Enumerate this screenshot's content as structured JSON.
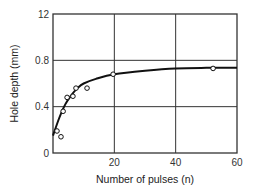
{
  "chart_data": {
    "type": "scatter",
    "title": "",
    "xlabel": "Number of pulses (n)",
    "ylabel": "Hole depth (mm)",
    "xlim": [
      0,
      60
    ],
    "ylim": [
      0,
      1.2
    ],
    "xticks": [
      {
        "value": 0,
        "label": ""
      },
      {
        "value": 20,
        "label": "20"
      },
      {
        "value": 40,
        "label": "40"
      },
      {
        "value": 60,
        "label": "60"
      }
    ],
    "yticks": [
      {
        "value": 0,
        "label": "0"
      },
      {
        "value": 0.4,
        "label": "0.4"
      },
      {
        "value": 0.8,
        "label": "0.8"
      },
      {
        "value": 1.2,
        "label": "12"
      }
    ],
    "grid": true,
    "legend": "none",
    "series": [
      {
        "name": "measured",
        "kind": "points",
        "marker": "open-circle",
        "x": [
          1.3,
          2.6,
          3.3,
          4.6,
          6.5,
          7.5,
          11.1,
          19.6,
          52.2
        ],
        "y": [
          0.19,
          0.14,
          0.36,
          0.48,
          0.49,
          0.56,
          0.56,
          0.68,
          0.73
        ]
      },
      {
        "name": "fit",
        "kind": "line",
        "x": [
          0,
          2,
          4,
          6,
          8,
          10,
          14,
          20,
          30,
          40,
          50,
          60
        ],
        "y": [
          0.15,
          0.3,
          0.42,
          0.5,
          0.56,
          0.6,
          0.64,
          0.68,
          0.71,
          0.73,
          0.735,
          0.735
        ]
      }
    ]
  },
  "colors": {
    "axis": "#333333",
    "grid": "#333333",
    "line": "#111111",
    "marker_fill": "#ffffff"
  }
}
